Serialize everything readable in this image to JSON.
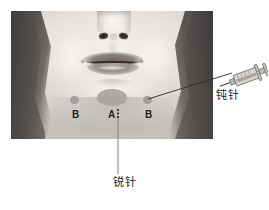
{
  "figure": {
    "type": "annotated-medical-photo",
    "background_color": "#ffffff",
    "photo": {
      "left": 11,
      "top": 11,
      "width": 202,
      "height": 128,
      "is_grayscale": true
    }
  },
  "markers": [
    {
      "id": "b-left",
      "label": "B",
      "shape": "dot",
      "color": "#9a9691"
    },
    {
      "id": "a-center",
      "label": "A",
      "shape": "ellipse",
      "color": "#a7a29c"
    },
    {
      "id": "b-right",
      "label": "B",
      "shape": "dot",
      "color": "#9a9691"
    }
  ],
  "annotations": {
    "blunt_needle": {
      "text": "钝针",
      "icon": "syringe-icon",
      "points_to": "b-right",
      "color": "#1b1918"
    },
    "sharp_needle": {
      "text": "锐针",
      "points_to": "a-center",
      "color": "#1b1918"
    }
  },
  "leader_lines": {
    "blunt": {
      "from_x": 232,
      "from_y": 74,
      "to_x": 148,
      "to_y": 99,
      "color": "#2b2927"
    },
    "sharp": {
      "from_x": 118,
      "from_y": 112,
      "to_x": 118,
      "to_y": 174,
      "color": "#6f6c69"
    }
  }
}
